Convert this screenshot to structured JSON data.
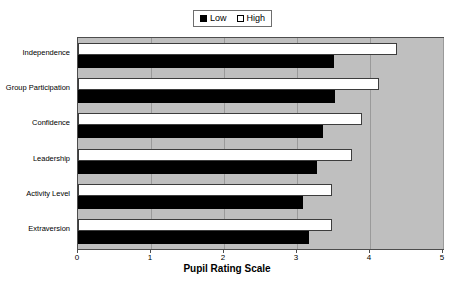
{
  "chart_data": {
    "type": "bar",
    "orientation": "horizontal",
    "title": "",
    "xlabel": "Pupil Rating Scale",
    "ylabel": "",
    "xlim": [
      0,
      5
    ],
    "xticks": [
      0,
      1,
      2,
      3,
      4,
      5
    ],
    "xtick_labels": [
      "0",
      "1",
      "2",
      "3",
      "4",
      "5"
    ],
    "grid": true,
    "grid_axis": "x",
    "legend_position": "top-center",
    "categories": [
      "Independence",
      "Group Participation",
      "Confidence",
      "Leadership",
      "Activity Level",
      "Extraversion"
    ],
    "series": [
      {
        "name": "Low",
        "color": "#000000",
        "values": [
          3.5,
          3.52,
          3.36,
          3.27,
          3.08,
          3.16
        ]
      },
      {
        "name": "High",
        "color": "#ffffff",
        "values": [
          4.37,
          4.12,
          3.89,
          3.75,
          3.48,
          3.48
        ]
      }
    ],
    "plot_background": "#bfbfbf",
    "gridline_color": "#9a9a9a"
  },
  "legend": {
    "entries": [
      {
        "label": "Low",
        "swatch": "filled-black-square"
      },
      {
        "label": "High",
        "swatch": "open-white-square"
      }
    ]
  },
  "axis": {
    "x_title": "Pupil Rating Scale",
    "x_tick_labels": [
      "0",
      "1",
      "2",
      "3",
      "4",
      "5"
    ]
  }
}
